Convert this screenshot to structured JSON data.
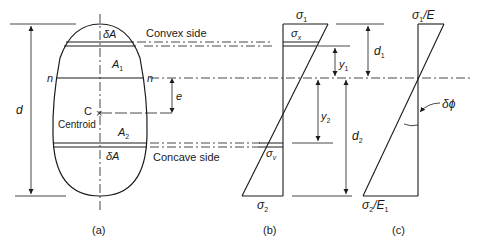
{
  "figure": {
    "panels": [
      {
        "id": "a",
        "caption": "(a)"
      },
      {
        "id": "b",
        "caption": "(b)"
      },
      {
        "id": "c",
        "caption": "(c)"
      }
    ]
  },
  "panel_a": {
    "delta_a_top": "δA",
    "delta_a_bottom": "δA",
    "a1": "A",
    "a1_sub": "1",
    "a2": "A",
    "a2_sub": "2",
    "n_left": "n",
    "n_right": "n",
    "c_label": "C",
    "centroid_label": "Centroid",
    "centroid_marker": "×",
    "d_label": "d",
    "e_label": "e",
    "convex_label": "Convex side",
    "concave_label": "Concave side"
  },
  "panel_b": {
    "sigma1": "σ",
    "sigma1_sub": "1",
    "sigmax": "σ",
    "sigmax_sub": "x",
    "sigmav": "σ",
    "sigmav_sub": "v",
    "sigma2": "σ",
    "sigma2_sub": "2",
    "y1": "y",
    "y1_sub": "1",
    "y2": "y",
    "y2_sub": "2",
    "d1": "d",
    "d1_sub": "1",
    "d2": "d",
    "d2_sub": "2"
  },
  "panel_c": {
    "top_label_sigma": "σ",
    "top_label_sub": "1",
    "top_label_rest": "/E",
    "bottom_label_sigma": "σ",
    "bottom_label_sub": "2",
    "bottom_label_rest": "/E",
    "bottom_label_rest_sub": "1",
    "dphi": "δϕ"
  }
}
